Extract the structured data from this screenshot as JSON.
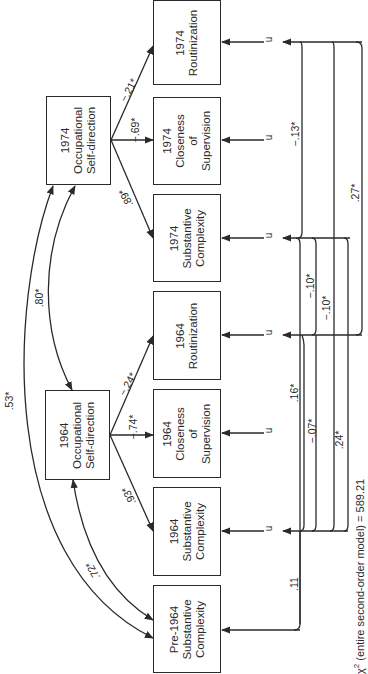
{
  "diagram": {
    "orientation": "rotated-90-ccw",
    "latent": [
      {
        "id": "osd1974",
        "lines": [
          "1974",
          "Occupational",
          "Self-direction"
        ]
      },
      {
        "id": "osd1964",
        "lines": [
          "1964",
          "Occupational",
          "Self-direction"
        ]
      }
    ],
    "indicators": [
      {
        "id": "rout1974",
        "lines": [
          "1974",
          "Routinization"
        ]
      },
      {
        "id": "close1974",
        "lines": [
          "1974",
          "Closeness",
          "of",
          "Supervision"
        ]
      },
      {
        "id": "subst1974",
        "lines": [
          "1974",
          "Substantive",
          "Complexity"
        ]
      },
      {
        "id": "rout1964",
        "lines": [
          "1964",
          "Routinization"
        ]
      },
      {
        "id": "close1964",
        "lines": [
          "1964",
          "Closeness",
          "of",
          "Supervision"
        ]
      },
      {
        "id": "subst1964",
        "lines": [
          "1964",
          "Substantive",
          "Complexity"
        ]
      },
      {
        "id": "pre1964",
        "lines": [
          "Pre-1964",
          "Substantive",
          "Complexity"
        ]
      }
    ],
    "loadings": {
      "osd1974_rout": "−.21*",
      "osd1974_close": "−.69*",
      "osd1974_subst": ".89*",
      "osd1964_rout": "−.24*",
      "osd1964_close": "−.74*",
      "osd1964_subst": ".93*"
    },
    "paths": {
      "osd1974_osd1964": ".80*",
      "osd1974_pre1964": ".53*",
      "osd1964_pre1964": ".72*"
    },
    "residual_label": "u",
    "residual_correlations": {
      "rout1974_subst1974": "−.13*",
      "rout1974_rout1964": ".27*",
      "subst1974_rout1964": "−.10*",
      "subst1974_subst1964": "−.10*",
      "rout1964_subst1964": ".16*",
      "rout1964_pre1964": "−.07*",
      "subst1974_pre1964": ".24*",
      "subst1964_pre1964": ".11"
    },
    "fit": {
      "chi_symbol": "χ",
      "chi_sup": "2",
      "text": "(entire second-order model)  =  589.21"
    }
  }
}
